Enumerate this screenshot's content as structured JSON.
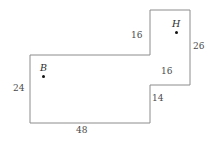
{
  "figure": {
    "type": "polygon-diagram",
    "stroke_color": "#8c8c8c",
    "background_color": "#ffffff",
    "vertices": [
      {
        "x": 30,
        "y": 55
      },
      {
        "x": 150,
        "y": 55
      },
      {
        "x": 150,
        "y": 10
      },
      {
        "x": 190,
        "y": 10
      },
      {
        "x": 190,
        "y": 85
      },
      {
        "x": 150,
        "y": 85
      },
      {
        "x": 150,
        "y": 123
      },
      {
        "x": 30,
        "y": 123
      }
    ],
    "points": [
      {
        "id": "point-b",
        "label": "B",
        "label_x": 40,
        "label_y": 63,
        "dot_x": 42,
        "dot_y": 75
      },
      {
        "id": "point-h",
        "label": "H",
        "label_x": 172,
        "label_y": 19,
        "dot_x": 175,
        "dot_y": 31
      }
    ],
    "dimensions": [
      {
        "id": "dim-top-left-vertical",
        "value": "16",
        "x": 131,
        "y": 31
      },
      {
        "id": "dim-right-vertical",
        "value": "26",
        "x": 193,
        "y": 42
      },
      {
        "id": "dim-step-horizontal",
        "value": "16",
        "x": 161,
        "y": 67
      },
      {
        "id": "dim-left-vertical",
        "value": "24",
        "x": 13,
        "y": 84
      },
      {
        "id": "dim-step-vertical",
        "value": "14",
        "x": 152,
        "y": 94
      },
      {
        "id": "dim-bottom-horizontal",
        "value": "48",
        "x": 76,
        "y": 126
      }
    ]
  }
}
